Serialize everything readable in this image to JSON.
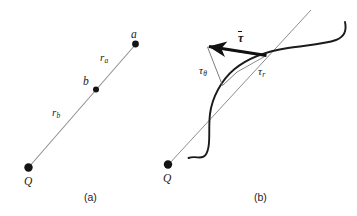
{
  "figure": {
    "type": "physics-vector-diagram",
    "background_color": "#ffffff",
    "ink_color": "#1a1a1a",
    "line_color": "#8a8a8a",
    "curve_color": "#1a1a1a",
    "panels": [
      {
        "id": "a",
        "caption": "(a)",
        "description": "Radial line from source charge Q through points b and a",
        "source_label": "Q",
        "point_labels": [
          "a",
          "b"
        ],
        "distance_labels": [
          "r_a",
          "r_b"
        ],
        "labels": {
          "source": "Q",
          "point_a": "a",
          "point_b": "b",
          "r_a_base": "r",
          "r_a_sub": "a",
          "r_b_base": "r",
          "r_b_sub": "b"
        }
      },
      {
        "id": "b",
        "caption": "(b)",
        "description": "Arbitrary curved path crossing the radial line from Q, with vector tau resolved into radial and angular components",
        "source_label": "Q",
        "vector_label": "τ",
        "component_labels": [
          "τ_θ",
          "τ_r"
        ],
        "labels": {
          "source": "Q",
          "vector": "τ",
          "tau_theta_base": "τ",
          "tau_theta_sub": "θ",
          "tau_r_base": "τ",
          "tau_r_sub": "r"
        }
      }
    ]
  }
}
